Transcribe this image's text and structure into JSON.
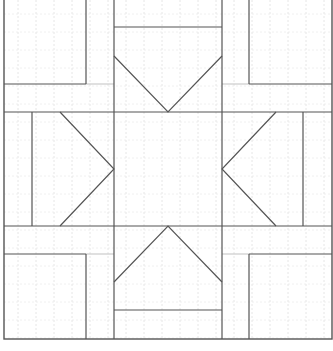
{
  "diagram": {
    "type": "quilt-block-pattern",
    "width": 333,
    "height": 351,
    "colors": {
      "background": "#ffffff",
      "line": "#555555",
      "light_line": "#cccccc",
      "grid": "#e6e6e6"
    },
    "grid": {
      "spacing": 18,
      "dashed": true
    },
    "border": {
      "x1": 4,
      "y1": -2,
      "x2": 332,
      "y2": 339
    },
    "lines": [
      {
        "id": "v-left-square-edge-top",
        "x1": 86,
        "y1": 0,
        "x2": 86,
        "y2": 84
      },
      {
        "id": "h-left-square-bottom-top",
        "x1": 4,
        "y1": 84,
        "x2": 86,
        "y2": 84
      },
      {
        "id": "v-center-left",
        "x1": 114,
        "y1": 0,
        "x2": 114,
        "y2": 339
      },
      {
        "id": "v-center-right",
        "x1": 222,
        "y1": 0,
        "x2": 222,
        "y2": 339
      },
      {
        "id": "h-center-top-bar",
        "x1": 114,
        "y1": 27,
        "x2": 222,
        "y2": 27
      },
      {
        "id": "v-right-square-edge-top",
        "x1": 249,
        "y1": 0,
        "x2": 249,
        "y2": 84
      },
      {
        "id": "h-right-square-bottom-top",
        "x1": 249,
        "y1": 84,
        "x2": 332,
        "y2": 84
      },
      {
        "id": "h-middle-top",
        "x1": 4,
        "y1": 112,
        "x2": 332,
        "y2": 112
      },
      {
        "id": "h-middle-bottom",
        "x1": 4,
        "y1": 226,
        "x2": 332,
        "y2": 226
      },
      {
        "id": "v-left-strip",
        "x1": 32,
        "y1": 112,
        "x2": 32,
        "y2": 226
      },
      {
        "id": "v-right-strip",
        "x1": 303,
        "y1": 112,
        "x2": 303,
        "y2": 226
      },
      {
        "id": "h-left-square-top-bottom",
        "x1": 4,
        "y1": 254,
        "x2": 86,
        "y2": 254
      },
      {
        "id": "v-left-square-edge-bottom",
        "x1": 86,
        "y1": 254,
        "x2": 86,
        "y2": 339
      },
      {
        "id": "h-right-square-top-bottom",
        "x1": 249,
        "y1": 254,
        "x2": 332,
        "y2": 254
      },
      {
        "id": "v-right-square-edge-bottom",
        "x1": 249,
        "y1": 254,
        "x2": 249,
        "y2": 339
      },
      {
        "id": "h-center-bottom-bar",
        "x1": 114,
        "y1": 310,
        "x2": 222,
        "y2": 310
      }
    ],
    "light_lines": [
      {
        "id": "h-light-top-left",
        "x1": 86,
        "y1": 84,
        "x2": 114,
        "y2": 84
      },
      {
        "id": "h-light-top-right",
        "x1": 222,
        "y1": 84,
        "x2": 249,
        "y2": 84
      },
      {
        "id": "h-light-bottom-left",
        "x1": 86,
        "y1": 254,
        "x2": 114,
        "y2": 254
      },
      {
        "id": "h-light-bottom-right",
        "x1": 222,
        "y1": 254,
        "x2": 249,
        "y2": 254
      }
    ],
    "triangles": [
      {
        "id": "triangle-top",
        "points": "114,56 168,112 222,56"
      },
      {
        "id": "triangle-left",
        "points": "60,112 114,169 60,226"
      },
      {
        "id": "triangle-right",
        "points": "276,112 222,169 276,226"
      },
      {
        "id": "triangle-bottom",
        "points": "114,282 168,226 222,282"
      }
    ]
  }
}
